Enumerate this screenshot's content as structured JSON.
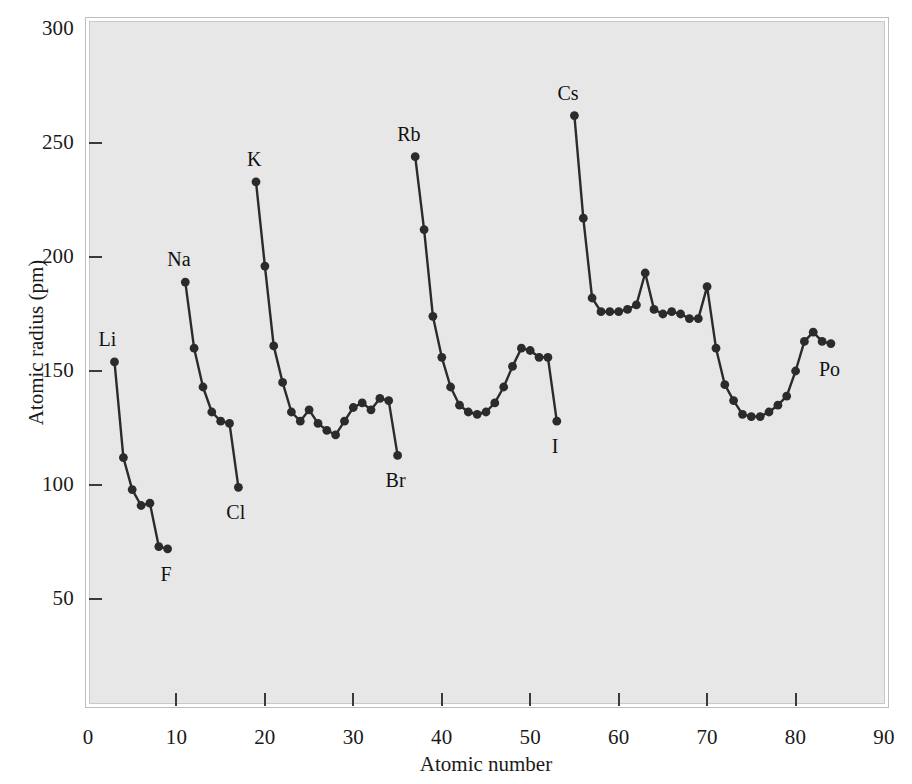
{
  "chart_data": {
    "type": "line",
    "title": "",
    "xlabel": "Atomic number",
    "ylabel": "Atomic radius (pm)",
    "xlim": [
      0,
      90
    ],
    "ylim": [
      0,
      300
    ],
    "xticks": [
      0,
      10,
      20,
      30,
      40,
      50,
      60,
      70,
      80,
      90
    ],
    "yticks": [
      50,
      100,
      150,
      200,
      250,
      300
    ],
    "grid": false,
    "legend": null,
    "marker": "filled-circle",
    "line_color": "#2b2b2b",
    "plot_background": "#e7e7e7",
    "series": [
      {
        "name": "Period 2",
        "x": [
          3,
          4,
          5,
          6,
          7,
          8,
          9
        ],
        "values": [
          154,
          112,
          98,
          91,
          92,
          73,
          72
        ]
      },
      {
        "name": "Period 3",
        "x": [
          11,
          12,
          13,
          14,
          15,
          16,
          17
        ],
        "values": [
          189,
          160,
          143,
          132,
          128,
          127,
          99
        ]
      },
      {
        "name": "Period 4",
        "x": [
          19,
          20,
          21,
          22,
          23,
          24,
          25,
          26,
          27,
          28,
          29,
          30,
          31,
          32,
          33,
          34,
          35
        ],
        "values": [
          233,
          196,
          161,
          145,
          132,
          128,
          133,
          127,
          124,
          122,
          128,
          134,
          136,
          133,
          138,
          137,
          113
        ]
      },
      {
        "name": "Period 5",
        "x": [
          37,
          38,
          39,
          40,
          41,
          42,
          43,
          44,
          45,
          46,
          47,
          48,
          49,
          50,
          51,
          52,
          53
        ],
        "values": [
          244,
          212,
          174,
          156,
          143,
          135,
          132,
          131,
          132,
          136,
          143,
          152,
          160,
          159,
          156,
          156,
          128
        ]
      },
      {
        "name": "Period 6",
        "x": [
          55,
          56,
          57,
          58,
          59,
          60,
          61,
          62,
          63,
          64,
          65,
          66,
          67,
          68,
          69,
          70,
          71,
          72,
          73,
          74,
          75,
          76,
          77,
          78,
          79,
          80,
          81,
          82,
          83,
          84
        ],
        "values": [
          262,
          217,
          182,
          176,
          176,
          176,
          177,
          179,
          193,
          177,
          175,
          176,
          175,
          173,
          173,
          187,
          160,
          144,
          137,
          131,
          130,
          130,
          132,
          135,
          139,
          150,
          163,
          167,
          163,
          162
        ]
      }
    ],
    "point_labels": [
      {
        "text": "Li",
        "x": 3,
        "y": 154,
        "dx": -8,
        "dy": -24
      },
      {
        "text": "F",
        "x": 9,
        "y": 72,
        "dx": -4,
        "dy": 24
      },
      {
        "text": "Na",
        "x": 11,
        "y": 189,
        "dx": -10,
        "dy": -24
      },
      {
        "text": "Cl",
        "x": 17,
        "y": 99,
        "dx": -4,
        "dy": 24
      },
      {
        "text": "K",
        "x": 19,
        "y": 233,
        "dx": -6,
        "dy": -24
      },
      {
        "text": "Br",
        "x": 35,
        "y": 113,
        "dx": -4,
        "dy": 24
      },
      {
        "text": "Rb",
        "x": 37,
        "y": 244,
        "dx": -10,
        "dy": -24
      },
      {
        "text": "I",
        "x": 53,
        "y": 128,
        "dx": -2,
        "dy": 24
      },
      {
        "text": "Cs",
        "x": 55,
        "y": 262,
        "dx": -9,
        "dy": -24
      },
      {
        "text": "Po",
        "x": 84,
        "y": 162,
        "dx": -4,
        "dy": 24
      }
    ]
  }
}
